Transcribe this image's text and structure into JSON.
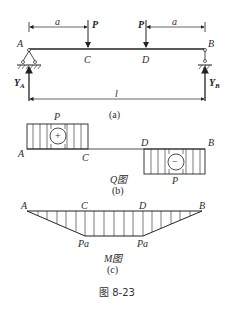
{
  "figure": {
    "caption": "图 8-23",
    "beam": {
      "points": {
        "A": "A",
        "B": "B",
        "C": "C",
        "D": "D"
      },
      "loads": [
        "P",
        "P"
      ],
      "dimensions": {
        "left": "a",
        "right": "a",
        "span": "l"
      },
      "reactions": {
        "left": "Y",
        "left_sub": "A",
        "right": "Y",
        "right_sub": "B"
      },
      "sublabel": "(a)"
    },
    "shear": {
      "title": "Q图",
      "sublabel": "(b)",
      "points": {
        "A": "A",
        "B": "B",
        "C": "C",
        "D": "D"
      },
      "positive_value": "P",
      "negative_value": "P",
      "positive_sign": "+",
      "negative_sign": "−"
    },
    "moment": {
      "title": "M图",
      "sublabel": "(c)",
      "points": {
        "A": "A",
        "B": "B",
        "C": "C",
        "D": "D"
      },
      "values": [
        "Pa",
        "Pa"
      ]
    }
  }
}
